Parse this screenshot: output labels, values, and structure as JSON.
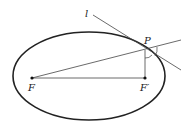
{
  "diagram": {
    "type": "ellipse-reflection",
    "labels": {
      "tangent_line": "l",
      "point": "P",
      "focus_1": "F",
      "focus_2": "F′"
    },
    "colors": {
      "stroke": "#222222",
      "background": "#ffffff"
    }
  }
}
